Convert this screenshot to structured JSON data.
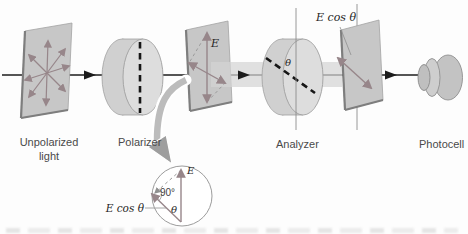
{
  "labels": {
    "unpolarized_light": "Unpolarized light",
    "polarizer": "Polarizer",
    "analyzer": "Analyzer",
    "photocell": "Photocell",
    "e_field": "E",
    "e_cos_theta_top": "E cos θ",
    "theta_analyzer": "θ",
    "inset": {
      "e_field": "E",
      "right_angle": "90°",
      "e_cos_theta": "E cos θ",
      "theta": "θ"
    }
  },
  "colors": {
    "background": "#fdfdfd",
    "plane_fill": "#c7c7c7",
    "plane_edge": "#a3a3a3",
    "plane_edge_dark": "#7e7e7e",
    "disc_fill": "#d0d0d0",
    "disc_face": "#dddddd",
    "disc_edge": "#9f9f9f",
    "beam_fill": "#d4d4d4",
    "vector_arrow": "#97868a",
    "ray_black": "#1c1c1c",
    "axis_dash": "#161616",
    "ref_line": "#8d8d8d",
    "label_gray": "#4a4a4a",
    "math_black": "#1f1f1f",
    "callout_fill": "#bcbcbc",
    "callout_head": "#9e9e9e"
  }
}
